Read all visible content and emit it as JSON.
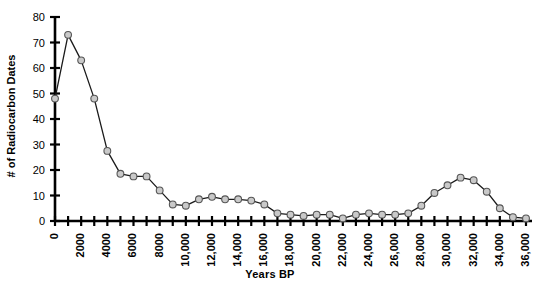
{
  "chart_data": {
    "type": "line",
    "title": "",
    "xlabel": "Years BP",
    "ylabel": "# of Radiocarbon Dates",
    "xlim": [
      0,
      36000
    ],
    "ylim": [
      0,
      80
    ],
    "ytick_step": 10,
    "xtick_step": 1000,
    "xtick_label_step": 2000,
    "grid": false,
    "legend": false,
    "marker": "circle",
    "marker_fill": "#c9c9c9",
    "marker_edge": "#555555",
    "line_color": "#1a1a1a",
    "axis_color": "#000000",
    "yticks": [
      0,
      10,
      20,
      30,
      40,
      50,
      60,
      70,
      80
    ],
    "ytick_labels": [
      "0",
      "10",
      "20",
      "30",
      "40",
      "50",
      "60",
      "70",
      "80"
    ],
    "xticks": [
      0,
      1000,
      2000,
      3000,
      4000,
      5000,
      6000,
      7000,
      8000,
      9000,
      10000,
      11000,
      12000,
      13000,
      14000,
      15000,
      16000,
      17000,
      18000,
      19000,
      20000,
      21000,
      22000,
      23000,
      24000,
      25000,
      26000,
      27000,
      28000,
      29000,
      30000,
      31000,
      32000,
      33000,
      34000,
      35000,
      36000
    ],
    "xtick_labels": [
      "0",
      "2000",
      "4000",
      "6000",
      "8000",
      "10,000",
      "12,000",
      "14,000",
      "16,000",
      "18,000",
      "20,000",
      "22,000",
      "24,000",
      "26,000",
      "28,000",
      "30,000",
      "32,000",
      "34,000",
      "36,000"
    ],
    "xtick_label_values": [
      0,
      2000,
      4000,
      6000,
      8000,
      10000,
      12000,
      14000,
      16000,
      18000,
      20000,
      22000,
      24000,
      26000,
      28000,
      30000,
      32000,
      34000,
      36000
    ],
    "x": [
      0,
      1000,
      2000,
      3000,
      4000,
      5000,
      6000,
      7000,
      8000,
      9000,
      10000,
      11000,
      12000,
      13000,
      14000,
      15000,
      16000,
      17000,
      18000,
      19000,
      20000,
      21000,
      22000,
      23000,
      24000,
      25000,
      26000,
      27000,
      28000,
      29000,
      30000,
      31000,
      32000,
      33000,
      34000,
      35000,
      36000
    ],
    "values": [
      48,
      73,
      63,
      48,
      27.5,
      18.5,
      17.5,
      17.5,
      12,
      6.5,
      6,
      8.5,
      9.5,
      8.5,
      8.5,
      8,
      6.5,
      3,
      2.5,
      2,
      2.5,
      2.5,
      1,
      2.5,
      3,
      2.5,
      2.5,
      3,
      6,
      11,
      14,
      17,
      16,
      11.5,
      5,
      1.5,
      1
    ]
  }
}
